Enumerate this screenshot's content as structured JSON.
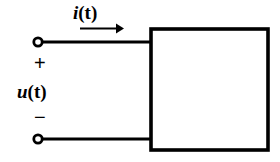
{
  "figure": {
    "type": "circuit-diagram",
    "background_color": "#ffffff",
    "line_color": "#000000"
  },
  "labels": {
    "current": {
      "symbol": "i",
      "arg": "(t)",
      "full": "i(t)"
    },
    "voltage": {
      "symbol": "u",
      "arg": "(t)",
      "full": "u(t)"
    },
    "polarity_positive": "+",
    "polarity_negative": "−"
  },
  "geometry": {
    "top_terminal": {
      "cx": 38,
      "cy": 42,
      "r_outer": 5.5,
      "r_inner": 2.6
    },
    "bottom_terminal": {
      "cx": 38,
      "cy": 139,
      "r_outer": 5.5,
      "r_inner": 2.6
    },
    "top_wire": {
      "x1": 43,
      "y1": 42,
      "x2": 150,
      "y2": 42
    },
    "bottom_wire": {
      "x1": 43,
      "y1": 139,
      "x2": 150,
      "y2": 139
    },
    "box": {
      "x": 149,
      "y": 27,
      "width": 120,
      "height": 124
    },
    "current_arrow": {
      "x1": 80,
      "y1": 28,
      "x2": 122,
      "y2": 28
    },
    "wire_width": 3,
    "box_border_width": 4
  }
}
